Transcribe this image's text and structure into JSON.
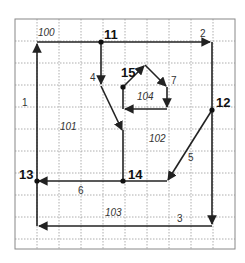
{
  "diagram": {
    "type": "planar-graph-on-grid",
    "grid": {
      "x0": 15,
      "y0": 19,
      "cell": 22,
      "cols": 10,
      "rows": 10,
      "line_color": "#999999",
      "border_color": "#777777"
    },
    "nodes": [
      {
        "id": "11",
        "label": "11",
        "x": 101,
        "y": 42,
        "lx": 104,
        "ly": 28
      },
      {
        "id": "12",
        "label": "12",
        "x": 212,
        "y": 110,
        "lx": 216,
        "ly": 96
      },
      {
        "id": "13",
        "label": "13",
        "x": 37,
        "y": 181,
        "lx": 19,
        "ly": 168
      },
      {
        "id": "14",
        "label": "14",
        "x": 123,
        "y": 181,
        "lx": 128,
        "ly": 168
      },
      {
        "id": "15",
        "label": "15",
        "x": 123,
        "y": 87,
        "lx": 121,
        "ly": 66
      }
    ],
    "edges": [
      {
        "label": "1",
        "lx": 22,
        "ly": 98
      },
      {
        "label": "2",
        "lx": 200,
        "ly": 29
      },
      {
        "label": "3",
        "lx": 177,
        "ly": 214
      },
      {
        "label": "4",
        "lx": 90,
        "ly": 73
      },
      {
        "label": "5",
        "lx": 188,
        "ly": 153
      },
      {
        "label": "6",
        "lx": 78,
        "ly": 186
      },
      {
        "label": "7",
        "lx": 171,
        "ly": 76
      }
    ],
    "regions": [
      {
        "label": "100",
        "lx": 38,
        "ly": 28
      },
      {
        "label": "101",
        "lx": 60,
        "ly": 122
      },
      {
        "label": "102",
        "lx": 149,
        "ly": 134
      },
      {
        "label": "103",
        "lx": 105,
        "ly": 208
      },
      {
        "label": "104",
        "lx": 137,
        "ly": 92
      }
    ],
    "stroke_color": "#222222"
  }
}
